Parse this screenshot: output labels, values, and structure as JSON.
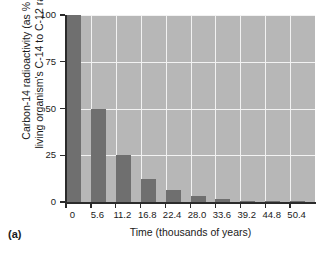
{
  "panel": {
    "label": "(a)"
  },
  "chart_data": {
    "type": "bar",
    "title": "",
    "subtitle": "",
    "xlabel": "Time (thousands of years)",
    "ylabel_line1": "Carbon-14 radioactivity (as % of",
    "ylabel_line2": "living organism's C-14 to C-12 ratio)",
    "categories": [
      "0",
      "5.6",
      "11.2",
      "16.8",
      "22.4",
      "28.0",
      "33.6",
      "39.2",
      "44.8",
      "50.4"
    ],
    "values": [
      100,
      50,
      25,
      12.5,
      6.25,
      3.1,
      1.6,
      0.8,
      0.4,
      0.2
    ],
    "x": [
      0,
      5.6,
      11.2,
      16.8,
      22.4,
      28.0,
      33.6,
      39.2,
      44.8,
      50.4
    ],
    "xlim": [
      0,
      56
    ],
    "ylim": [
      0,
      100
    ],
    "ytick_labels": [
      "0",
      "25",
      "50",
      "75",
      "100"
    ],
    "ytick_values": [
      0,
      25,
      50,
      75,
      100
    ],
    "xtick_labels": [
      "0",
      "5.6",
      "11.2",
      "16.8",
      "22.4",
      "28.0",
      "33.6",
      "39.2",
      "44.8",
      "50.4"
    ],
    "grid": true,
    "legend": "none",
    "bar_color": "#6f6f6f",
    "plot_background": "#b7b7b7",
    "gridline_color": "#f2f2f2",
    "axis_color": "#2b2b2b"
  }
}
